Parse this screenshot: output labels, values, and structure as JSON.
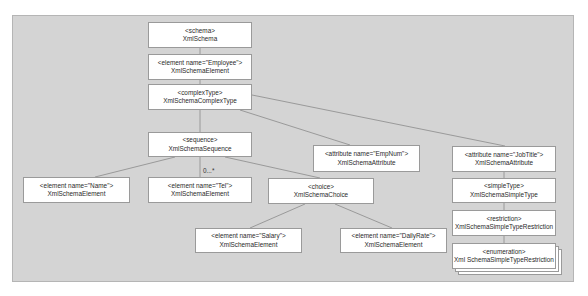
{
  "diagram": {
    "nodes": [
      {
        "id": "schema",
        "tag": "<schema>",
        "cls": "XmlSchema"
      },
      {
        "id": "employee",
        "tag": "<element name=\"Employee\">",
        "cls": "XmlSchemaElement"
      },
      {
        "id": "complextype",
        "tag": "<complexType>",
        "cls": "XmlSchemaComplexType"
      },
      {
        "id": "sequence",
        "tag": "<sequence>",
        "cls": "XmlSchemaSequence"
      },
      {
        "id": "empnum",
        "tag": "<attribute name=\"EmpNum\">",
        "cls": "XmlSchemaAttribute"
      },
      {
        "id": "jobtitle",
        "tag": "<attribute name=\"JobTitle\">",
        "cls": "XmlSchemaAttribute"
      },
      {
        "id": "name",
        "tag": "<element name=\"Name\">",
        "cls": "XmlSchemaElement"
      },
      {
        "id": "tel",
        "tag": "<element name=\"Tel\">",
        "cls": "XmlSchemaElement"
      },
      {
        "id": "choice",
        "tag": "<choice>",
        "cls": "XmlSchemaChoice"
      },
      {
        "id": "simpletype",
        "tag": "<simpleType>",
        "cls": "XmlSchemaSimpleType"
      },
      {
        "id": "restriction",
        "tag": "<restriction>",
        "cls": "XmlSchemaSimpleTypeRestriction"
      },
      {
        "id": "salary",
        "tag": "<element name=\"Salary\">",
        "cls": "XmlSchemaElement"
      },
      {
        "id": "dailyrate",
        "tag": "<element name=\"DailyRate\">",
        "cls": "XmlSchemaElement"
      },
      {
        "id": "enumeration",
        "tag": "<enumeration>",
        "cls": "Xml SchemaSimpleTypeRestriction"
      }
    ],
    "multiplicity_label": "0...*",
    "colors": {
      "background": "#d4d4d4",
      "node_fill": "#ffffff",
      "node_border": "#9a9a9a",
      "line": "#8a8a8a"
    }
  }
}
